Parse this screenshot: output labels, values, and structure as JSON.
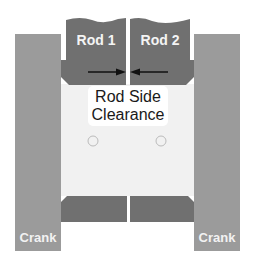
{
  "diagram": {
    "rods": [
      {
        "label": "Rod 1"
      },
      {
        "label": "Rod 2"
      }
    ],
    "cranks": [
      {
        "label": "Crank"
      },
      {
        "label": "Crank"
      }
    ],
    "annotation": {
      "line1": "Rod Side",
      "line2": "Clearance"
    },
    "colors": {
      "crank": "#9b9b9b",
      "rod": "#707070",
      "bearing": "#f1f1f1",
      "arrow": "#111111"
    }
  }
}
